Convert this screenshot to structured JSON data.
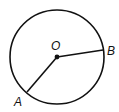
{
  "diagram": {
    "type": "circle-geometry",
    "circle": {
      "cx": 57,
      "cy": 57,
      "r": 47,
      "stroke": "#111111"
    },
    "center": {
      "label": "O",
      "x": 57,
      "y": 57
    },
    "points": [
      {
        "label": "B",
        "x": 103,
        "y": 50
      },
      {
        "label": "A",
        "x": 27,
        "y": 92
      }
    ],
    "segments": [
      {
        "from": "O",
        "to": "B"
      },
      {
        "from": "O",
        "to": "A"
      }
    ],
    "labels": {
      "O": "O",
      "B": "B",
      "A": "A"
    }
  }
}
